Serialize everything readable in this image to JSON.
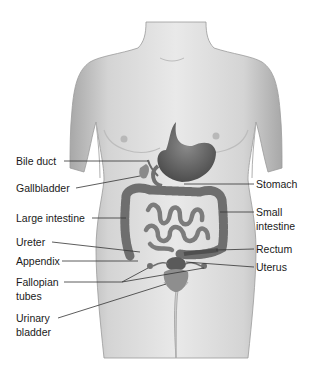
{
  "diagram": {
    "labels": {
      "left": [
        {
          "id": "bile-duct",
          "text": "Bile duct",
          "x": 16,
          "y": 155
        },
        {
          "id": "gallbladder",
          "text": "Gallbladder",
          "x": 16,
          "y": 181
        },
        {
          "id": "large-intestine",
          "text": "Large intestine",
          "x": 16,
          "y": 212
        },
        {
          "id": "ureter",
          "text": "Ureter",
          "x": 16,
          "y": 236
        },
        {
          "id": "appendix",
          "text": "Appendix",
          "x": 16,
          "y": 255
        },
        {
          "id": "fallopian-tubes",
          "text": "Fallopian\ntubes",
          "x": 16,
          "y": 276
        },
        {
          "id": "urinary-bladder",
          "text": "Urinary\nbladder",
          "x": 16,
          "y": 311
        }
      ],
      "right": [
        {
          "id": "stomach",
          "text": "Stomach",
          "x": 256,
          "y": 179
        },
        {
          "id": "small-intestine",
          "text": "Small\nintestine",
          "x": 256,
          "y": 205
        },
        {
          "id": "rectum",
          "text": "Rectum",
          "x": 256,
          "y": 243
        },
        {
          "id": "uterus",
          "text": "Uterus",
          "x": 256,
          "y": 261
        }
      ]
    },
    "colors": {
      "skin_light": "#e6e6e6",
      "skin_mid": "#c9c9c9",
      "skin_dark": "#9a9a9a",
      "organ": "#6f6f6f",
      "organ_dark": "#4a4a4a",
      "leader_line": "#333333",
      "text": "#1a1a1a"
    }
  }
}
